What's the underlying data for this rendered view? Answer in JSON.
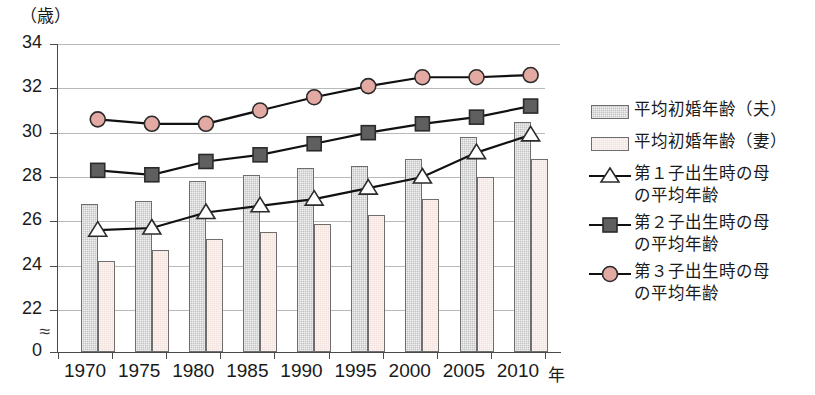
{
  "chart_data": {
    "type": "bar",
    "title": "",
    "subtitle": "",
    "xlabel": "年",
    "ylabel": "（歳）",
    "ylim": [
      0,
      34
    ],
    "y_axis_break": true,
    "y_break_symbol": "≈",
    "grid": true,
    "legend_position": "right",
    "categories": [
      "1970",
      "1975",
      "1980",
      "1985",
      "1990",
      "1995",
      "2000",
      "2005",
      "2010"
    ],
    "yticks": [
      "34",
      "32",
      "30",
      "28",
      "26",
      "24",
      "22",
      "0"
    ],
    "ytick_values": [
      34,
      32,
      30,
      28,
      26,
      24,
      22,
      0
    ],
    "series": [
      {
        "name": "平均初婚年齢（夫）",
        "kind": "bar",
        "color": "#c3c3c3",
        "values": [
          26.8,
          26.9,
          27.8,
          28.1,
          28.4,
          28.5,
          28.8,
          29.8,
          30.5
        ]
      },
      {
        "name": "平均初婚年齢（妻）",
        "kind": "bar",
        "color": "#f3e1dc",
        "values": [
          24.2,
          24.7,
          25.2,
          25.5,
          25.9,
          26.3,
          27.0,
          28.0,
          28.8
        ]
      },
      {
        "name": "第１子出生時の母\nの平均年齢",
        "kind": "line",
        "marker": "triangle",
        "color": "#ffffff",
        "values": [
          25.6,
          25.7,
          26.4,
          26.7,
          27.0,
          27.5,
          28.0,
          29.1,
          29.9
        ]
      },
      {
        "name": "第２子出生時の母\nの平均年齢",
        "kind": "line",
        "marker": "square",
        "color": "#5f5f5f",
        "values": [
          28.3,
          28.1,
          28.7,
          29.0,
          29.5,
          30.0,
          30.4,
          30.7,
          31.2
        ]
      },
      {
        "name": "第３子出生時の母\nの平均年齢",
        "kind": "line",
        "marker": "circle",
        "color": "#e3a9a3",
        "values": [
          30.6,
          30.4,
          30.4,
          31.0,
          31.6,
          32.1,
          32.5,
          32.5,
          32.6
        ]
      }
    ]
  },
  "legend": {
    "items": [
      {
        "label": "平均初婚年齢（夫）",
        "key": "bar-gray-swatch"
      },
      {
        "label": "平均初婚年齢（妻）",
        "key": "bar-pink-swatch"
      },
      {
        "label": "第１子出生時の母\nの平均年齢",
        "key": "line-triangle-marker"
      },
      {
        "label": "第２子出生時の母\nの平均年齢",
        "key": "line-square-marker"
      },
      {
        "label": "第３子出生時の母\nの平均年齢",
        "key": "line-circle-marker"
      }
    ]
  },
  "axes": {
    "y_unit": "（歳）",
    "x_unit": "年"
  }
}
